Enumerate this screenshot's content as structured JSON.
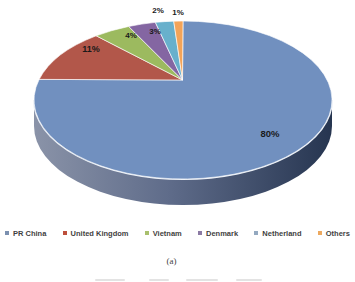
{
  "chart_data": {
    "type": "pie",
    "style": "3d-pie",
    "title": "",
    "categories": [
      "PR China",
      "United Kingdom",
      "Vietnam",
      "Denmark",
      "Netherland",
      "Others"
    ],
    "values": [
      80,
      11,
      4,
      3,
      2,
      1
    ],
    "labels": [
      "80%",
      "11%",
      "4%",
      "3%",
      "2%",
      "1%"
    ],
    "colors": [
      "#7190bf",
      "#b2574a",
      "#9cba5f",
      "#8466a2",
      "#68b0cc",
      "#f3a459"
    ],
    "legend_colors": [
      "#7b90b0",
      "#bd4f3c",
      "#a9c06d",
      "#8b7aa4",
      "#94a9c0",
      "#eda95f"
    ],
    "side_gradient": [
      "#8a93a8",
      "#5f6c8a",
      "#263550"
    ],
    "rim_color": "#e9eef5",
    "label_color": "#1a1a1a",
    "legend_position": "bottom",
    "start_angle_deg": 0,
    "direction": "clockwise"
  },
  "caption": {
    "label": "(a)"
  }
}
